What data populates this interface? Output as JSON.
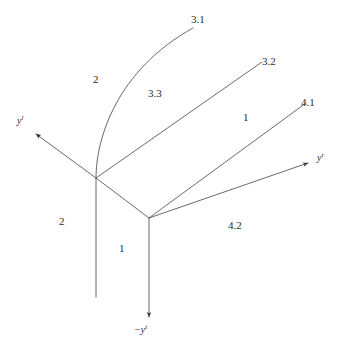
{
  "figure": {
    "type": "node-ray-diagram",
    "background_color": "#ffffff",
    "stroke_color": "#555555"
  },
  "axes": [
    {
      "id": "y-left",
      "base": "y",
      "superscript": "l",
      "label": "y",
      "sup": "l",
      "direction": "upper-left",
      "arrow": true
    },
    {
      "id": "y-right",
      "base": "y",
      "superscript": "r",
      "label": "y",
      "sup": "r",
      "direction": "right",
      "arrow": true
    },
    {
      "id": "y-bottom",
      "base": "−y",
      "superscript": "t",
      "label": "−y",
      "sup": "t",
      "direction": "down",
      "arrow": true
    }
  ],
  "node_labels": [
    {
      "id": "label-3-1",
      "text": "3.1"
    },
    {
      "id": "label-3-2",
      "text": "3.2"
    },
    {
      "id": "label-3-3",
      "text": "3.3"
    },
    {
      "id": "label-4-1",
      "text": "4.1"
    },
    {
      "id": "label-4-2",
      "text": "4.2"
    },
    {
      "id": "label-2-upper",
      "text": "2"
    },
    {
      "id": "label-2-lower",
      "text": "2"
    },
    {
      "id": "label-1-middle",
      "text": "1"
    },
    {
      "id": "label-1-lower",
      "text": "1"
    }
  ],
  "vertices": [
    {
      "id": "vertex-left",
      "x": 96,
      "y": 178
    },
    {
      "id": "vertex-right",
      "x": 149,
      "y": 218
    }
  ],
  "edges": [
    {
      "id": "edge-left-to-3-1",
      "kind": "curve",
      "from": "vertex-left",
      "to": "3.1"
    },
    {
      "id": "edge-left-to-3-2",
      "kind": "line",
      "from": "vertex-left",
      "to": "3.2"
    },
    {
      "id": "edge-left-to-right",
      "kind": "line",
      "from": "vertex-left",
      "to": "vertex-right"
    },
    {
      "id": "edge-left-axis",
      "kind": "arrow",
      "from": "vertex-left",
      "to": "y-left"
    },
    {
      "id": "edge-left-vertical",
      "kind": "line",
      "from": "vertex-left",
      "to": "stub-bottom"
    },
    {
      "id": "edge-right-to-4-1",
      "kind": "line",
      "from": "vertex-right",
      "to": "4.1"
    },
    {
      "id": "edge-right-axis",
      "kind": "arrow",
      "from": "vertex-right",
      "to": "y-right"
    },
    {
      "id": "edge-right-vertical",
      "kind": "arrow",
      "from": "vertex-right",
      "to": "y-bottom"
    }
  ]
}
